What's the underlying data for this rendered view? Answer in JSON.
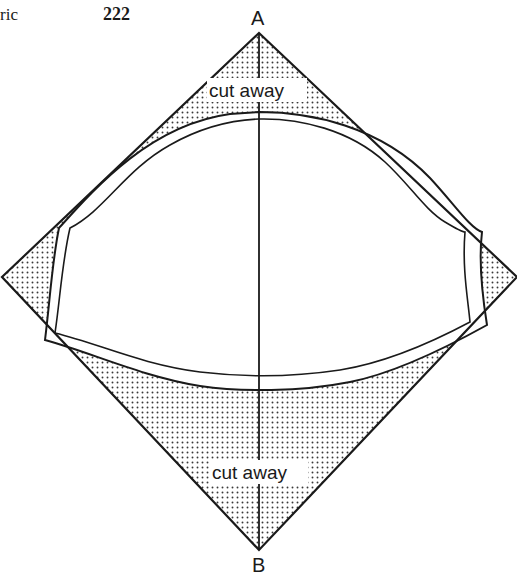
{
  "header": {
    "running_head": "ric",
    "page_number": "222"
  },
  "diagram": {
    "type": "sewing pattern on bias-cut fabric square",
    "points": {
      "top_label": "A",
      "bottom_label": "B"
    },
    "annotations": {
      "top_cut_label": "cut away",
      "bottom_cut_label": "cut away"
    },
    "colors": {
      "line": "#1a1a1a",
      "stipple": "#3a3a3a",
      "background": "#ffffff"
    }
  }
}
